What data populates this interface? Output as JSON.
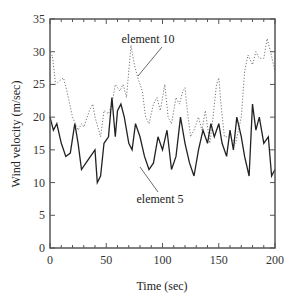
{
  "chart_data": {
    "type": "line",
    "title": "",
    "xlabel": "Time (sec)",
    "ylabel": "Wind velocity (m/sec)",
    "xlim": [
      0,
      200
    ],
    "ylim": [
      0,
      35
    ],
    "x_ticks": [
      0,
      50,
      100,
      150,
      200
    ],
    "y_ticks": [
      0,
      5,
      10,
      15,
      20,
      25,
      30,
      35
    ],
    "x_minor_step": 10,
    "grid": false,
    "legend": "none (inline annotations)",
    "annotations": [
      {
        "text": "element 10",
        "points_to_series": "element 10"
      },
      {
        "text": "element 5",
        "points_to_series": "element 5"
      }
    ],
    "series": [
      {
        "name": "element 10",
        "style": "dotted",
        "x": [
          0,
          2,
          5,
          8,
          12,
          15,
          20,
          25,
          28,
          30,
          35,
          38,
          40,
          45,
          48,
          52,
          55,
          58,
          62,
          65,
          68,
          72,
          75,
          78,
          82,
          85,
          88,
          92,
          95,
          98,
          102,
          105,
          108,
          112,
          115,
          118,
          120,
          122,
          125,
          128,
          132,
          135,
          138,
          142,
          145,
          148,
          150,
          152,
          155,
          160,
          165,
          170,
          173,
          176,
          180,
          183,
          186,
          190,
          193,
          196,
          200
        ],
        "values": [
          29,
          29.5,
          25,
          25.5,
          26,
          24,
          20,
          18,
          19,
          18.5,
          21,
          22,
          20,
          17,
          21,
          20.5,
          22,
          25,
          24,
          25,
          23,
          31,
          28,
          26,
          24,
          20,
          19,
          22,
          23,
          21,
          25,
          20,
          19,
          23,
          22,
          24,
          24.5,
          21,
          17,
          18,
          20,
          18,
          21,
          16,
          20,
          25,
          26,
          22,
          17,
          17,
          16,
          20,
          27,
          29.5,
          28,
          30,
          29,
          29,
          32,
          30,
          27
        ]
      },
      {
        "name": "element 5",
        "style": "solid",
        "x": [
          0,
          3,
          6,
          10,
          14,
          18,
          22,
          25,
          28,
          32,
          36,
          40,
          42,
          45,
          48,
          52,
          55,
          58,
          60,
          63,
          66,
          70,
          73,
          76,
          80,
          84,
          88,
          92,
          96,
          100,
          104,
          108,
          112,
          116,
          120,
          124,
          128,
          132,
          136,
          140,
          143,
          146,
          150,
          153,
          157,
          160,
          163,
          166,
          170,
          173,
          177,
          180,
          183,
          186,
          190,
          194,
          197,
          200
        ],
        "values": [
          20,
          18,
          19,
          16,
          14,
          14.5,
          19,
          16,
          12,
          13,
          14,
          15,
          10,
          11,
          16,
          17,
          23,
          17,
          21,
          22,
          20,
          16,
          15,
          19,
          17,
          14,
          12,
          13,
          17,
          15,
          18,
          12,
          14,
          20,
          16,
          13,
          11,
          15,
          18,
          16,
          19,
          17,
          19,
          16,
          14,
          18,
          15,
          20,
          17,
          14,
          11,
          22,
          18,
          20,
          16,
          17,
          11,
          12
        ]
      }
    ]
  },
  "labels": {
    "xlabel": "Time (sec)",
    "ylabel": "Wind velocity (m/sec)",
    "anno_element10": "element 10",
    "anno_element5": "element 5"
  }
}
